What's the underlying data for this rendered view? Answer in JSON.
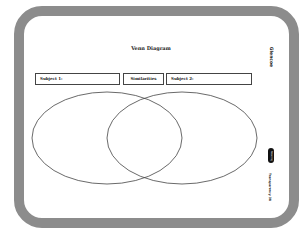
{
  "title": "Venn Diagram",
  "boxes": {
    "subject1": "Subject 1:",
    "similarities": "Similarities",
    "subject2": "Subject 2:"
  },
  "side": {
    "logo": "Glencoe",
    "badge": "Reading",
    "transparency": "Transparency 38"
  },
  "colors": {
    "frame": "#8c8c8c",
    "lines": "#444444"
  }
}
